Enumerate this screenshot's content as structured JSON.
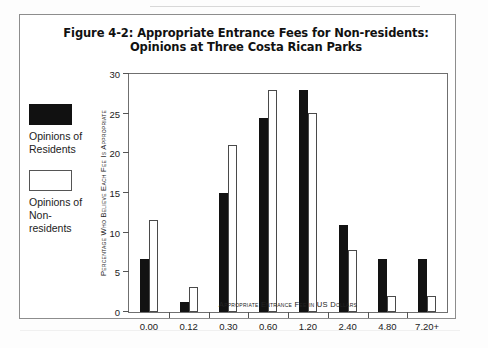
{
  "figure": {
    "title_line1": "Figure 4-2: Appropriate Entrance Fees for Non-residents:",
    "title_line2": "Opinions at Three Costa Rican Parks"
  },
  "legend": {
    "items": [
      {
        "swatch": "black",
        "label": "Opinions of Residents",
        "color": "#121212"
      },
      {
        "swatch": "white",
        "label": "Opinions of Non-residents",
        "color": "#ffffff"
      }
    ]
  },
  "chart_data": {
    "type": "bar",
    "title": "Figure 4-2: Appropriate Entrance Fees for Non-residents: Opinions at Three Costa Rican Parks",
    "xlabel": "Appropriate Entrance Fee in US Dollars",
    "ylabel": "Percentage Who Believe Each Fee Is Appropriate",
    "categories": [
      "0.00",
      "0.12",
      "0.30",
      "0.60",
      "1.20",
      "2.40",
      "4.80",
      "7.20+"
    ],
    "series": [
      {
        "name": "Opinions of Residents",
        "color": "#121212",
        "values": [
          6.7,
          1.2,
          15.0,
          24.5,
          28.0,
          11.0,
          6.7,
          6.7
        ]
      },
      {
        "name": "Opinions of Non-residents",
        "color": "#ffffff",
        "values": [
          11.6,
          3.1,
          21.0,
          28.0,
          25.1,
          7.8,
          2.0,
          2.0
        ]
      }
    ],
    "ylim": [
      0,
      30
    ],
    "yticks": [
      0,
      5,
      10,
      15,
      20,
      25,
      30
    ],
    "grid": false,
    "legend_position": "left-outside"
  }
}
